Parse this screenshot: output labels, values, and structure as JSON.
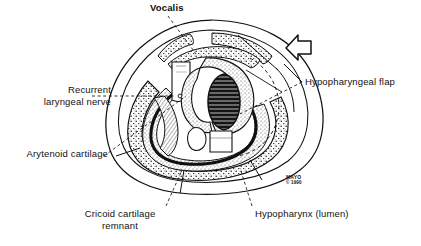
{
  "figure": {
    "credit": {
      "org": "MAYO",
      "copyright": "© 1990"
    },
    "ink_color": "#111111",
    "background_color": "#ffffff",
    "labels": [
      {
        "id": "vocalis",
        "text": "Vocalis",
        "lines": [
          "Vocalis"
        ]
      },
      {
        "id": "recurrent-nerve",
        "text": "Recurrent laryngeal nerve",
        "lines": [
          "Recurrent",
          "laryngeal nerve"
        ]
      },
      {
        "id": "arytenoid",
        "text": "Arytenoid cartilage",
        "lines": [
          "Arytenoid cartilage"
        ]
      },
      {
        "id": "cricoid",
        "text": "Cricoid cartilage remnant",
        "lines": [
          "Cricoid cartilage",
          "remnant"
        ]
      },
      {
        "id": "hypopharyngeal-flap",
        "text": "Hypopharyngeal flap",
        "lines": [
          "Hypopharyngeal flap"
        ]
      },
      {
        "id": "hypopharynx-lumen",
        "text": "Hypopharynx (lumen)",
        "lines": [
          "Hypopharynx (lumen)"
        ]
      }
    ],
    "annotations": {
      "arrow": "flap-direction-arrow"
    }
  },
  "text": {
    "vocalis": "Vocalis",
    "recurrent_l1": "Recurrent",
    "recurrent_l2": "laryngeal nerve",
    "arytenoid": "Arytenoid cartilage",
    "cricoid_l1": "Cricoid cartilage",
    "cricoid_l2": "remnant",
    "hypopharyngeal_flap": "Hypopharyngeal flap",
    "hypopharynx_lumen": "Hypopharynx (lumen)",
    "mayo": "MAYO",
    "mayo_copyright": "© 1990"
  }
}
